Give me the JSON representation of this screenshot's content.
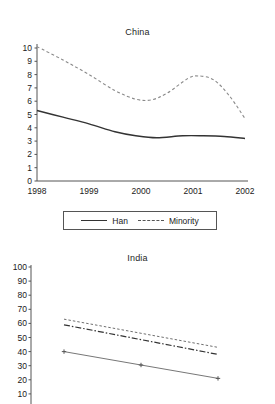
{
  "chart_data": [
    {
      "type": "line",
      "title": "China",
      "xlabel": "",
      "ylabel": "",
      "x": [
        1998,
        1999,
        2000,
        2001,
        2002
      ],
      "xticklabels": [
        "1998",
        "1999",
        "2000",
        "2001",
        "2002"
      ],
      "yticklabels": [
        "0",
        "1",
        "2",
        "3",
        "4",
        "5",
        "6",
        "7",
        "8",
        "9",
        "10"
      ],
      "ylim": [
        0,
        10
      ],
      "grid": false,
      "legend_position": "bottom",
      "series": [
        {
          "name": "Han",
          "style": "solid",
          "values": [
            5.3,
            4.3,
            3.4,
            3.4,
            3.2
          ],
          "points": [
            [
              1998,
              5.3
            ],
            [
              1998.5,
              4.8
            ],
            [
              1999,
              4.3
            ],
            [
              1999.5,
              3.7
            ],
            [
              1999.9,
              3.4
            ],
            [
              2000.3,
              3.25
            ],
            [
              2000.8,
              3.4
            ],
            [
              2001.2,
              3.4
            ],
            [
              2001.6,
              3.35
            ],
            [
              2002,
              3.2
            ]
          ]
        },
        {
          "name": "Minority",
          "style": "dashed",
          "values": [
            10.1,
            7.9,
            6.1,
            7.9,
            4.7
          ],
          "points": [
            [
              1998,
              10.1
            ],
            [
              1998.5,
              9.1
            ],
            [
              1999,
              8.0
            ],
            [
              1999.5,
              6.8
            ],
            [
              1999.9,
              6.15
            ],
            [
              2000.2,
              6.1
            ],
            [
              2000.5,
              6.6
            ],
            [
              2000.9,
              7.7
            ],
            [
              2001.1,
              7.9
            ],
            [
              2001.4,
              7.6
            ],
            [
              2001.7,
              6.4
            ],
            [
              2002,
              4.7
            ]
          ]
        }
      ]
    },
    {
      "type": "line",
      "title": "India",
      "xlabel": "",
      "ylabel": "",
      "x": [
        1998,
        2000,
        2002
      ],
      "xticklabels": [],
      "yticklabels": [
        "10",
        "20",
        "30",
        "40",
        "50",
        "60",
        "70",
        "80",
        "90",
        "100"
      ],
      "ylim": [
        0,
        100
      ],
      "grid": false,
      "legend_position": "none",
      "series": [
        {
          "name": "series-dotted-upper",
          "style": "dotted",
          "values": [
            63,
            53,
            43
          ],
          "points": [
            [
              1998,
              63
            ],
            [
              2000,
              53
            ],
            [
              2002,
              43
            ]
          ]
        },
        {
          "name": "series-dashdot-middle",
          "style": "dash-dot",
          "values": [
            59,
            48.5,
            38
          ],
          "points": [
            [
              1998,
              59
            ],
            [
              2000,
              48.5
            ],
            [
              2002,
              38
            ]
          ]
        },
        {
          "name": "series-solid-lower",
          "style": "solid-markers",
          "values": [
            40,
            30.5,
            21
          ],
          "points": [
            [
              1998,
              40
            ],
            [
              2000,
              30.5
            ],
            [
              2002,
              21
            ]
          ]
        }
      ]
    }
  ],
  "legend": {
    "entries": [
      {
        "label": "Han",
        "style": "solid"
      },
      {
        "label": "Minority",
        "style": "dashed"
      }
    ]
  }
}
